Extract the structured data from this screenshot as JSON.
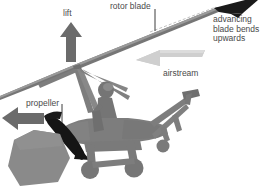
{
  "diagram": {
    "background_color": "#ffffff",
    "labels": {
      "lift": "lift",
      "rotor_blade": "rotor blade",
      "advancing": "advancing\nblade bends\nupwards",
      "airstream": "airstream",
      "propeller": "propeller"
    },
    "colors": {
      "text": "#4a4a4a",
      "arrow_dark": "#6b6b6b",
      "airstream_light": "#c9c9c9",
      "body_gray": "#7d7d7d",
      "body_gray_light": "#8e8e8e",
      "blade_black": "#1a1a1a",
      "leader_line": "#3c3c3c",
      "rotor_line": "#6f6f6f"
    },
    "elements": {
      "lift_arrow": "up-arrow",
      "thrust_arrow": "left-arrow",
      "airstream_arrow": "airstream-left-arrow",
      "rotor_blade": "rotor-blade-line",
      "advancing_tip": "black-blade-tip",
      "propeller": "black-propeller-blade",
      "pilot": "pilot-silhouette",
      "tail": "tail-boom-and-fin",
      "wheels": "landing-gear-wheels",
      "ground_shape": "gray-polygon"
    }
  }
}
